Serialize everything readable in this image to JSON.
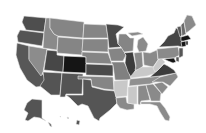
{
  "map": {
    "type": "choropleth",
    "region": "United States",
    "palette": {
      "darkest": "#151515",
      "very_dark": "#3c3c3c",
      "dark": "#545454",
      "medium_dark": "#6a6a6a",
      "medium": "#858585",
      "light": "#a0a0a0",
      "very_light": "#c8c8c8"
    },
    "states": [
      {
        "id": "WA",
        "shade": "#4e4e4e"
      },
      {
        "id": "OR",
        "shade": "#545454"
      },
      {
        "id": "CA",
        "shade": "#575757"
      },
      {
        "id": "NV",
        "shade": "#8c8c8c"
      },
      {
        "id": "ID",
        "shade": "#8a8a8a"
      },
      {
        "id": "MT",
        "shade": "#858585"
      },
      {
        "id": "WY",
        "shade": "#858585"
      },
      {
        "id": "UT",
        "shade": "#474747"
      },
      {
        "id": "AZ",
        "shade": "#545454"
      },
      {
        "id": "CO",
        "shade": "#151515"
      },
      {
        "id": "NM",
        "shade": "#545454"
      },
      {
        "id": "ND",
        "shade": "#858585"
      },
      {
        "id": "SD",
        "shade": "#858585"
      },
      {
        "id": "NE",
        "shade": "#858585"
      },
      {
        "id": "KS",
        "shade": "#4a4a4a"
      },
      {
        "id": "OK",
        "shade": "#858585"
      },
      {
        "id": "TX",
        "shade": "#555555"
      },
      {
        "id": "MN",
        "shade": "#4a4a4a"
      },
      {
        "id": "IA",
        "shade": "#858585"
      },
      {
        "id": "MO",
        "shade": "#808080"
      },
      {
        "id": "AR",
        "shade": "#c8c8c8"
      },
      {
        "id": "LA",
        "shade": "#8a8a8a"
      },
      {
        "id": "WI",
        "shade": "#858585"
      },
      {
        "id": "IL",
        "shade": "#3c3c3c"
      },
      {
        "id": "MI",
        "shade": "#8a8a8a"
      },
      {
        "id": "IN",
        "shade": "#8a8a8a"
      },
      {
        "id": "OH",
        "shade": "#8a8a8a"
      },
      {
        "id": "KY",
        "shade": "#c8c8c8"
      },
      {
        "id": "TN",
        "shade": "#909090"
      },
      {
        "id": "MS",
        "shade": "#c8c8c8"
      },
      {
        "id": "AL",
        "shade": "#8a8a8a"
      },
      {
        "id": "GA",
        "shade": "#8a8a8a"
      },
      {
        "id": "FL",
        "shade": "#8a8a8a"
      },
      {
        "id": "SC",
        "shade": "#8a8a8a"
      },
      {
        "id": "NC",
        "shade": "#8a8a8a"
      },
      {
        "id": "VA",
        "shade": "#3c3c3c"
      },
      {
        "id": "WV",
        "shade": "#c8c8c8"
      },
      {
        "id": "PA",
        "shade": "#8a8a8a"
      },
      {
        "id": "NY",
        "shade": "#454545"
      },
      {
        "id": "VT",
        "shade": "#555555"
      },
      {
        "id": "NH",
        "shade": "#6a6a6a"
      },
      {
        "id": "ME",
        "shade": "#8a8a8a"
      },
      {
        "id": "MA",
        "shade": "#151515"
      },
      {
        "id": "CT",
        "shade": "#151515"
      },
      {
        "id": "RI",
        "shade": "#151515"
      },
      {
        "id": "NJ",
        "shade": "#555555"
      },
      {
        "id": "DE",
        "shade": "#555555"
      },
      {
        "id": "MD",
        "shade": "#151515"
      },
      {
        "id": "AK",
        "shade": "#545454"
      },
      {
        "id": "HI",
        "shade": "#545454"
      }
    ]
  }
}
